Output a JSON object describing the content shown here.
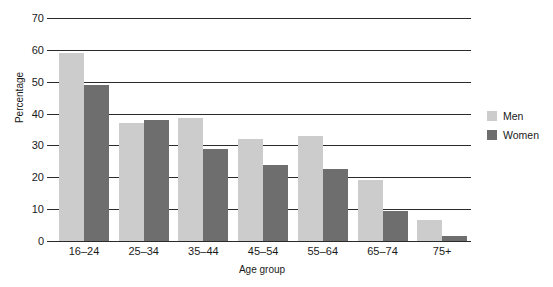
{
  "chart_data": {
    "type": "bar",
    "title": "",
    "xlabel": "Age group",
    "ylabel": "Percentage",
    "categories": [
      "16–24",
      "25–34",
      "35–44",
      "45–54",
      "55–64",
      "65–74",
      "75+"
    ],
    "series": [
      {
        "name": "Men",
        "values": [
          59,
          37,
          38.5,
          32,
          33,
          19,
          6.5
        ],
        "color": "#cccccc"
      },
      {
        "name": "Women",
        "values": [
          49,
          38,
          29,
          24,
          22.5,
          9.5,
          1.5
        ],
        "color": "#6e6e6e"
      }
    ],
    "ylim": [
      0,
      70
    ],
    "yticks": [
      0,
      10,
      20,
      30,
      40,
      50,
      60,
      70
    ],
    "ytick_labels": [
      "0",
      "10",
      "20",
      "30",
      "40",
      "50",
      "60",
      "70"
    ],
    "grid": true,
    "legend_position": "right"
  },
  "legend": {
    "items": [
      {
        "label": "Men",
        "color": "#cccccc"
      },
      {
        "label": "Women",
        "color": "#6e6e6e"
      }
    ]
  },
  "axes": {
    "y_title": "Percentage",
    "x_title": "Age group"
  }
}
